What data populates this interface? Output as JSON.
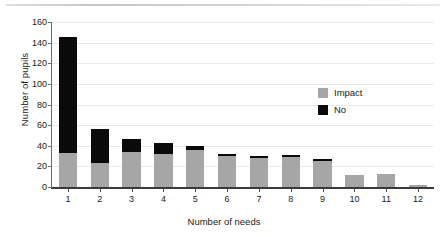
{
  "chart_data": {
    "type": "bar",
    "subtype": "stacked-vertical",
    "title": "",
    "xlabel": "Number of needs",
    "ylabel": "Number of pupils",
    "categories": [
      "1",
      "2",
      "3",
      "4",
      "5",
      "6",
      "7",
      "8",
      "9",
      "10",
      "11",
      "12"
    ],
    "series": [
      {
        "name": "Impact",
        "color": "#a6a6a6",
        "values": [
          33,
          23,
          34,
          32,
          36,
          30,
          28,
          29,
          25,
          12,
          13,
          2
        ]
      },
      {
        "name": "No",
        "color": "#0a0a0a",
        "values": [
          112,
          33,
          13,
          11,
          4,
          2,
          2,
          2,
          2,
          0,
          0,
          0
        ]
      }
    ],
    "totals": [
      145,
      56,
      47,
      43,
      40,
      32,
      30,
      31,
      27,
      12,
      13,
      2
    ],
    "ylim": [
      0,
      160
    ],
    "ytick_values": [
      0,
      20,
      40,
      60,
      80,
      100,
      120,
      140,
      160
    ],
    "ytick_labels": [
      "0",
      "20",
      "40",
      "60",
      "80",
      "100",
      "120",
      "140",
      "160"
    ],
    "grid": "horizontal",
    "legend_position": "inside-upper-right"
  },
  "legend": {
    "items": [
      {
        "label": "Impact",
        "color": "#a6a6a6"
      },
      {
        "label": "No",
        "color": "#0a0a0a"
      }
    ]
  }
}
